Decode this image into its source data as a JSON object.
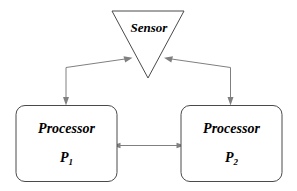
{
  "diagram": {
    "background_color": "#ffffff",
    "node_stroke_color": "#4a4a4a",
    "node_fill_color": "#ffffff",
    "edge_color": "#808080",
    "text_color": "#000000",
    "nodes": [
      {
        "id": "sensor",
        "shape": "triangle-down",
        "label": "Sensor",
        "sub_label": ""
      },
      {
        "id": "processor-1",
        "shape": "rounded-rectangle",
        "label": "Processor",
        "sub_label": "P",
        "sub_index": "1"
      },
      {
        "id": "processor-2",
        "shape": "rounded-rectangle",
        "label": "Processor",
        "sub_label": "P",
        "sub_index": "2"
      }
    ],
    "edges": [
      {
        "id": "edge-sensor-p1",
        "from": "sensor",
        "to": "processor-1",
        "direction": "bidirectional-polyline"
      },
      {
        "id": "edge-sensor-p2",
        "from": "sensor",
        "to": "processor-2",
        "direction": "bidirectional-polyline"
      },
      {
        "id": "edge-p1-p2",
        "from": "processor-1",
        "to": "processor-2",
        "direction": "bidirectional"
      }
    ]
  }
}
